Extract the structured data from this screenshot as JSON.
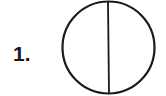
{
  "figure": {
    "label": "1.",
    "shape": "circle divided by vertical diameter",
    "parts": 2,
    "stroke_color": "#1a1a1a",
    "fill_color": "#ffffff"
  }
}
